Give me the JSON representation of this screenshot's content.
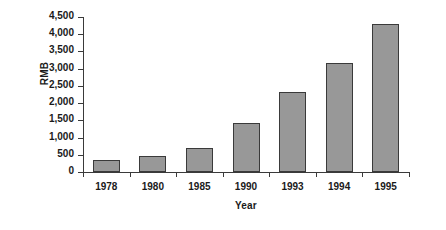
{
  "chart_data": {
    "type": "bar",
    "title": "",
    "subtitle": "",
    "xlabel": "Year",
    "ylabel": "RMB",
    "categories": [
      "1978",
      "1980",
      "1985",
      "1990",
      "1993",
      "1994",
      "1995"
    ],
    "values": [
      345,
      460,
      690,
      1410,
      2330,
      3170,
      4300
    ],
    "series": [
      {
        "name": "RMB",
        "values": [
          345,
          460,
          690,
          1410,
          2330,
          3170,
          4300
        ]
      }
    ],
    "ylim": [
      0,
      4500
    ],
    "ytick_step": 500,
    "ytick_labels": [
      "4,500",
      "4,000",
      "3,500",
      "3,000",
      "2,500",
      "2,000",
      "1,500",
      "1,000",
      "500",
      "0"
    ],
    "ytick_values": [
      4500,
      4000,
      3500,
      3000,
      2500,
      2000,
      1500,
      1000,
      500,
      0
    ],
    "grid": false,
    "legend": false,
    "legend_position": "none",
    "annotations": [],
    "colors": {
      "bar_fill": "#989898",
      "bar_border": "#3a3a3a",
      "axis": "#3a3a3a",
      "text": "#1a1a1a",
      "background": "#ffffff"
    }
  }
}
